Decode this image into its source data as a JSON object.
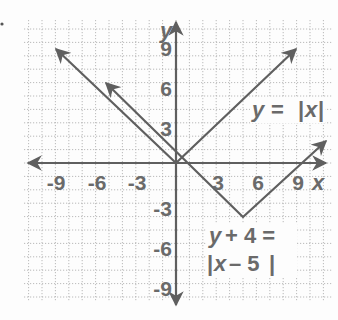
{
  "graph": {
    "axis_labels": {
      "x": "x",
      "y": "y"
    },
    "x_ticks": [
      {
        "value": -9,
        "label": "-9"
      },
      {
        "value": -6,
        "label": "-6"
      },
      {
        "value": -3,
        "label": "-3"
      },
      {
        "value": 3,
        "label": "3"
      },
      {
        "value": 6,
        "label": "6"
      },
      {
        "value": 9,
        "label": "9"
      }
    ],
    "y_ticks": [
      {
        "value": 9,
        "label": "9"
      },
      {
        "value": 6,
        "label": "6"
      },
      {
        "value": 3,
        "label": "3"
      },
      {
        "value": -3,
        "label": "-3"
      },
      {
        "value": -6,
        "label": "-6"
      },
      {
        "value": -9,
        "label": "-9"
      }
    ],
    "equations": {
      "parent": {
        "lhs": "y",
        "eq": "=",
        "rhs_open": "|",
        "rhs_var": "x",
        "rhs_close": "|"
      },
      "transformed": {
        "line1_lhs": "y",
        "line1_op": "+ 4 =",
        "line2_open": "|",
        "line2_var": "x",
        "line2_rest": "– 5",
        "line2_close": "|"
      }
    },
    "functions": [
      {
        "name": "y = |x|",
        "vertex": [
          0,
          0
        ],
        "left_end": [
          -9,
          9
        ],
        "right_end": [
          9,
          9
        ]
      },
      {
        "name": "y + 4 = |x - 5|",
        "vertex": [
          5,
          -4
        ],
        "left_end": [
          -5,
          6
        ],
        "right_end": [
          11,
          2
        ]
      }
    ],
    "grid": {
      "xmin": -11,
      "xmax": 11,
      "ymin": -10,
      "ymax": 10,
      "minor_step": 1
    },
    "colors": {
      "line": "#5f5f5f",
      "grid": "#a8a8a8",
      "text": "#6a6a6a",
      "background": "#fdfdfd"
    }
  }
}
